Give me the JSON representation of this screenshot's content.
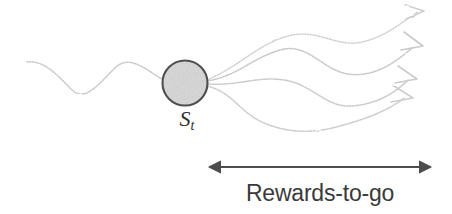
{
  "figure": {
    "background_color": "#ffffff",
    "state_label": "S",
    "state_label_subscript": "t",
    "span_caption": "Rewards-to-go",
    "colors": {
      "trajectory_stroke": "#c9c9c9",
      "past_trajectory_stroke": "#c4c4c4",
      "node_outline": "#4a4a4a",
      "node_fill": "#b4b4b4",
      "measure_arrow": "#4b4b4b",
      "caption_text": "#3a3a3a",
      "state_label_text": "#2e2e2e"
    },
    "state_node": {
      "name": "state-node",
      "center_x": 185,
      "center_y": 83,
      "radius": 23,
      "fill_style": "stippled-gray"
    },
    "past_trajectory": {
      "name": "past-trajectory",
      "start": [
        27,
        62
      ],
      "end": [
        163,
        82
      ],
      "style": "wavy-dotted"
    },
    "branches": [
      {
        "name": "branch-1",
        "arrow_tip": [
          426,
          10
        ],
        "label": "",
        "style": "wavy-dotted-arrow"
      },
      {
        "name": "branch-2",
        "arrow_tip": [
          426,
          46
        ],
        "label": "",
        "style": "wavy-dotted-arrow"
      },
      {
        "name": "branch-3",
        "arrow_tip": [
          419,
          78
        ],
        "label": "",
        "style": "wavy-dotted-arrow"
      },
      {
        "name": "branch-4",
        "arrow_tip": [
          415,
          98
        ],
        "label": "",
        "style": "wavy-dotted-arrow"
      }
    ],
    "measure_arrow": {
      "name": "rewards-to-go-span-arrow",
      "x_start": 209,
      "x_end": 431,
      "y": 167,
      "double_headed": true
    }
  }
}
